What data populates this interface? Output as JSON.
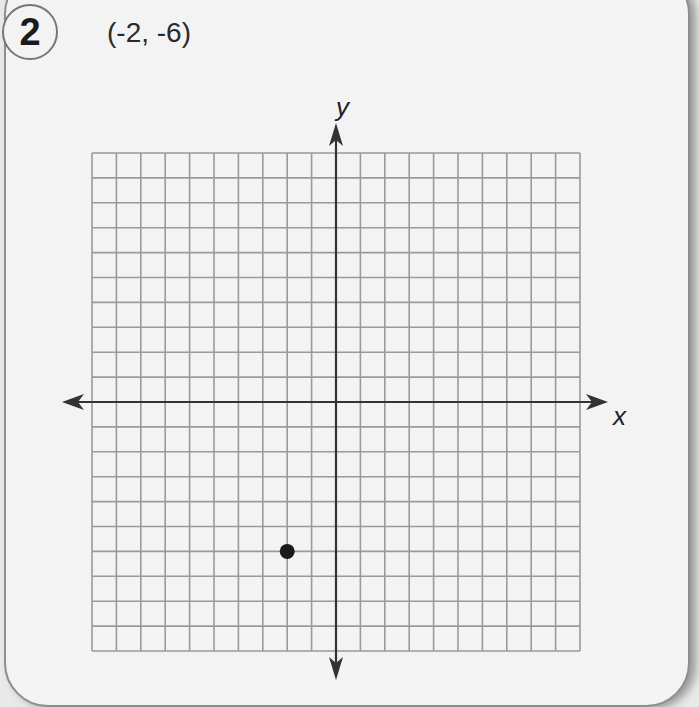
{
  "problem": {
    "number": "2",
    "prompt": "(-2, -6)"
  },
  "axes": {
    "x_label": "x",
    "y_label": "y"
  },
  "colors": {
    "grid": "#9a9a9a",
    "axis": "#333333",
    "point": "#1a1a1a",
    "card_bg": "#f3f3f3"
  },
  "chart_data": {
    "type": "scatter",
    "title": "(-2, -6)",
    "xlabel": "x",
    "ylabel": "y",
    "xlim": [
      -10,
      10
    ],
    "ylim": [
      -10,
      10
    ],
    "grid": true,
    "grid_cells": {
      "columns": 20,
      "rows": 20
    },
    "points": [
      {
        "x": -2,
        "y": -6
      }
    ],
    "annotations": [
      "Problem 2"
    ]
  }
}
